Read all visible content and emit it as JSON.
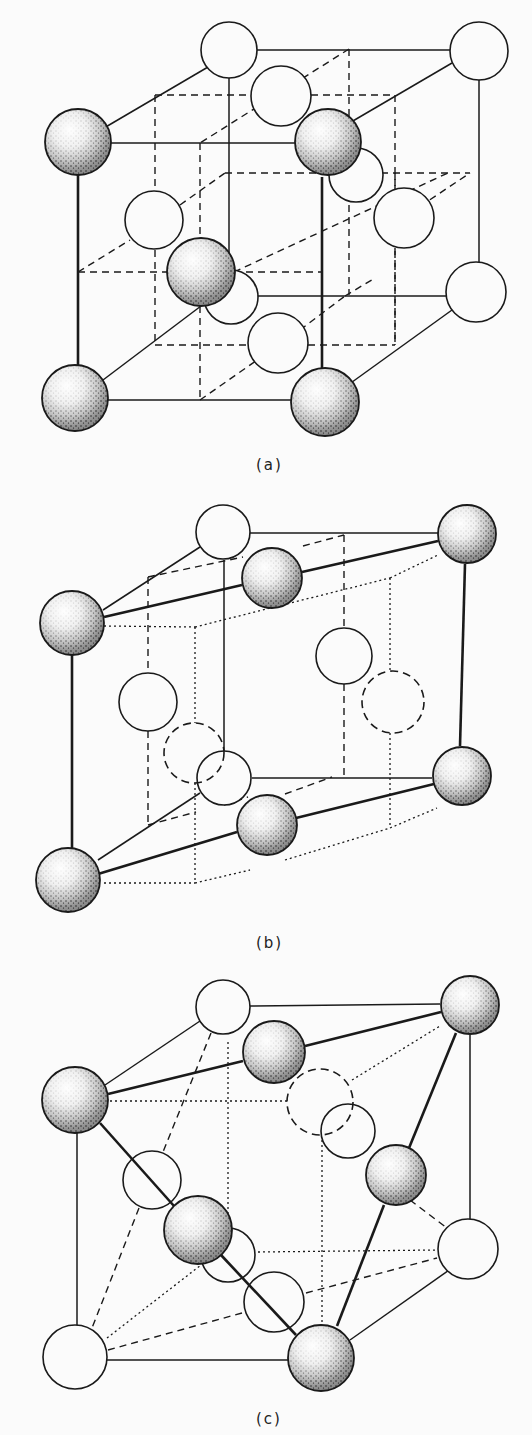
{
  "figure": {
    "background": "#fbfbfb",
    "ink": "#1a1a1a",
    "panels": [
      {
        "id": "a",
        "label": "(a)",
        "label_pos": [
          268,
          466
        ],
        "shaded_atoms": [
          {
            "id": "a-s1",
            "cx": 78,
            "cy": 142,
            "r": 33
          },
          {
            "id": "a-s2",
            "cx": 328,
            "cy": 142,
            "r": 33
          },
          {
            "id": "a-s3",
            "cx": 201,
            "cy": 272,
            "r": 34
          },
          {
            "id": "a-s4",
            "cx": 75,
            "cy": 398,
            "r": 33
          },
          {
            "id": "a-s5",
            "cx": 325,
            "cy": 402,
            "r": 34
          }
        ],
        "open_atoms": [
          {
            "id": "a-o1",
            "cx": 229,
            "cy": 50,
            "r": 28,
            "style": "solid"
          },
          {
            "id": "a-o2",
            "cx": 479,
            "cy": 51,
            "r": 29,
            "style": "solid"
          },
          {
            "id": "a-o3",
            "cx": 281,
            "cy": 96,
            "r": 30,
            "style": "solid"
          },
          {
            "id": "a-o4",
            "cx": 356,
            "cy": 175,
            "r": 27,
            "style": "solid"
          },
          {
            "id": "a-o5",
            "cx": 154,
            "cy": 220,
            "r": 29,
            "style": "solid"
          },
          {
            "id": "a-o6",
            "cx": 404,
            "cy": 218,
            "r": 30,
            "style": "solid"
          },
          {
            "id": "a-o7",
            "cx": 231,
            "cy": 297,
            "r": 27,
            "style": "solid"
          },
          {
            "id": "a-o8",
            "cx": 476,
            "cy": 292,
            "r": 30,
            "style": "solid"
          },
          {
            "id": "a-o9",
            "cx": 278,
            "cy": 343,
            "r": 30,
            "style": "solid"
          }
        ],
        "solid_lines": [
          [
            104,
            128,
            208,
            67
          ],
          [
            250,
            50,
            450,
            50
          ],
          [
            479,
            80,
            479,
            262
          ],
          [
            111,
            143,
            295,
            143
          ],
          [
            346,
            125,
            452,
            63
          ],
          [
            78,
            175,
            78,
            365
          ],
          [
            322,
            177,
            322,
            368
          ],
          [
            108,
            400,
            292,
            400
          ],
          [
            348,
            385,
            452,
            310
          ],
          [
            103,
            380,
            201,
            306
          ],
          [
            255,
            296,
            446,
            296
          ],
          [
            229,
            78,
            229,
            270
          ]
        ],
        "thick_lines": [
          [
            322,
            177,
            322,
            368
          ],
          [
            78,
            175,
            78,
            365
          ]
        ],
        "dashed_lines": [
          [
            155,
            95,
            395,
            95
          ],
          [
            395,
            95,
            395,
            345
          ],
          [
            155,
            95,
            155,
            190
          ],
          [
            155,
            250,
            155,
            345
          ],
          [
            155,
            345,
            248,
            345
          ],
          [
            308,
            345,
            395,
            345
          ],
          [
            78,
            272,
            168,
            272
          ],
          [
            234,
            272,
            450,
            172
          ],
          [
            234,
            272,
            322,
            272
          ],
          [
            349,
            49,
            200,
            143
          ],
          [
            349,
            49,
            349,
            295
          ],
          [
            200,
            143,
            200,
            240
          ],
          [
            200,
            306,
            200,
            400
          ],
          [
            78,
            272,
            130,
            240
          ],
          [
            180,
            205,
            225,
            173
          ],
          [
            225,
            173,
            470,
            173
          ],
          [
            200,
            400,
            300,
            330
          ],
          [
            300,
            330,
            345,
            296
          ],
          [
            395,
            173,
            395,
            190
          ],
          [
            395,
            248,
            395,
            345
          ],
          [
            380,
            233,
            470,
            173
          ],
          [
            345,
            296,
            375,
            278
          ]
        ]
      },
      {
        "id": "b",
        "label": "(b)",
        "label_pos": [
          268,
          944
        ],
        "shaded_atoms": [
          {
            "id": "b-s1",
            "cx": 72,
            "cy": 623,
            "r": 32
          },
          {
            "id": "b-s2",
            "cx": 272,
            "cy": 578,
            "r": 30
          },
          {
            "id": "b-s3",
            "cx": 467,
            "cy": 534,
            "r": 29
          },
          {
            "id": "b-s4",
            "cx": 462,
            "cy": 776,
            "r": 29
          },
          {
            "id": "b-s5",
            "cx": 267,
            "cy": 825,
            "r": 30
          },
          {
            "id": "b-s6",
            "cx": 68,
            "cy": 880,
            "r": 32
          }
        ],
        "open_atoms": [
          {
            "id": "b-o1",
            "cx": 223,
            "cy": 532,
            "r": 27,
            "style": "solid"
          },
          {
            "id": "b-o2",
            "cx": 344,
            "cy": 656,
            "r": 28,
            "style": "solid"
          },
          {
            "id": "b-o3",
            "cx": 148,
            "cy": 702,
            "r": 29,
            "style": "solid"
          },
          {
            "id": "b-o4",
            "cx": 224,
            "cy": 778,
            "r": 27,
            "style": "solid"
          },
          {
            "id": "b-o5",
            "cx": 393,
            "cy": 702,
            "r": 31,
            "style": "dashed"
          },
          {
            "id": "b-o6",
            "cx": 194,
            "cy": 753,
            "r": 30,
            "style": "dashed"
          }
        ],
        "solid_lines": [
          [
            103,
            610,
            200,
            547
          ],
          [
            249,
            533,
            438,
            533
          ],
          [
            224,
            560,
            224,
            760
          ],
          [
            252,
            778,
            432,
            778
          ],
          [
            98,
            860,
            200,
            793
          ]
        ],
        "thick_lines": [
          [
            104,
            617,
            242,
            585
          ],
          [
            302,
            572,
            438,
            541
          ],
          [
            72,
            655,
            72,
            848
          ],
          [
            465,
            564,
            460,
            746
          ],
          [
            98,
            874,
            237,
            832
          ],
          [
            296,
            818,
            434,
            784
          ]
        ],
        "dashed_lines": [
          [
            148,
            577,
            243,
            557
          ],
          [
            303,
            546,
            344,
            535
          ],
          [
            344,
            535,
            344,
            628
          ],
          [
            344,
            684,
            344,
            778
          ],
          [
            148,
            577,
            148,
            673
          ],
          [
            148,
            731,
            148,
            825
          ],
          [
            148,
            825,
            196,
            812
          ],
          [
            224,
            805,
            248,
            797
          ],
          [
            285,
            794,
            332,
            777
          ]
        ],
        "dotted_lines": [
          [
            104,
            626,
            195,
            627
          ],
          [
            195,
            627,
            390,
            578
          ],
          [
            390,
            578,
            438,
            555
          ],
          [
            195,
            627,
            195,
            723
          ],
          [
            195,
            783,
            195,
            883
          ],
          [
            104,
            883,
            195,
            883
          ],
          [
            195,
            883,
            250,
            870
          ],
          [
            285,
            860,
            390,
            828
          ],
          [
            390,
            828,
            437,
            808
          ],
          [
            390,
            578,
            390,
            671
          ],
          [
            390,
            733,
            390,
            828
          ]
        ]
      },
      {
        "id": "c",
        "label": "(c)",
        "label_pos": [
          268,
          1420
        ],
        "shaded_atoms": [
          {
            "id": "c-s1",
            "cx": 75,
            "cy": 1100,
            "r": 33
          },
          {
            "id": "c-s2",
            "cx": 274,
            "cy": 1052,
            "r": 31
          },
          {
            "id": "c-s3",
            "cx": 470,
            "cy": 1005,
            "r": 29
          },
          {
            "id": "c-s4",
            "cx": 396,
            "cy": 1175,
            "r": 30
          },
          {
            "id": "c-s5",
            "cx": 198,
            "cy": 1230,
            "r": 34
          },
          {
            "id": "c-s6",
            "cx": 321,
            "cy": 1358,
            "r": 33
          }
        ],
        "open_atoms": [
          {
            "id": "c-o1",
            "cx": 223,
            "cy": 1007,
            "r": 27,
            "style": "solid"
          },
          {
            "id": "c-o2",
            "cx": 348,
            "cy": 1131,
            "r": 27,
            "style": "solid"
          },
          {
            "id": "c-o3",
            "cx": 152,
            "cy": 1180,
            "r": 29,
            "style": "solid"
          },
          {
            "id": "c-o4",
            "cx": 228,
            "cy": 1255,
            "r": 27,
            "style": "solid"
          },
          {
            "id": "c-o5",
            "cx": 468,
            "cy": 1249,
            "r": 30,
            "style": "solid"
          },
          {
            "id": "c-o6",
            "cx": 274,
            "cy": 1302,
            "r": 30,
            "style": "solid"
          },
          {
            "id": "c-o7",
            "cx": 75,
            "cy": 1357,
            "r": 32,
            "style": "solid"
          },
          {
            "id": "c-o8",
            "cx": 320,
            "cy": 1102,
            "r": 33,
            "style": "dashed"
          }
        ],
        "solid_lines": [
          [
            105,
            1085,
            200,
            1021
          ],
          [
            249,
            1006,
            440,
            1004
          ],
          [
            470,
            1035,
            470,
            1219
          ],
          [
            77,
            1133,
            77,
            1325
          ],
          [
            107,
            1360,
            288,
            1360
          ],
          [
            350,
            1340,
            452,
            1268
          ]
        ],
        "thick_lines": [
          [
            108,
            1094,
            243,
            1061
          ],
          [
            305,
            1046,
            441,
            1012
          ],
          [
            100,
            1123,
            174,
            1206
          ],
          [
            221,
            1255,
            296,
            1335
          ],
          [
            456,
            1033,
            409,
            1148
          ],
          [
            384,
            1205,
            337,
            1326
          ]
        ],
        "dashed_lines": [
          [
            211,
            1033,
            163,
            1152
          ],
          [
            139,
            1208,
            92,
            1328
          ],
          [
            108,
            1350,
            242,
            1313
          ],
          [
            306,
            1293,
            437,
            1258
          ],
          [
            410,
            1200,
            447,
            1228
          ]
        ],
        "dotted_lines": [
          [
            110,
            1101,
            287,
            1101
          ],
          [
            352,
            1080,
            440,
            1026
          ],
          [
            228,
            1042,
            228,
            1228
          ],
          [
            322,
            1135,
            322,
            1325
          ],
          [
            258,
            1252,
            438,
            1250
          ],
          [
            107,
            1338,
            201,
            1265
          ]
        ]
      }
    ]
  }
}
